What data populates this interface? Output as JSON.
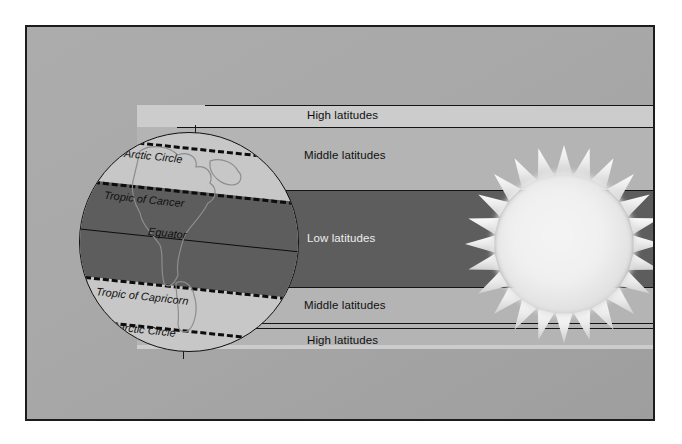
{
  "figure": {
    "panel_background": "#a8a8a8",
    "border_color": "#1c1c1c"
  },
  "colors": {
    "high_latitude_band": "#cccccc",
    "middle_latitude_band": "#b4b4b4",
    "low_latitude_band": "#5d5d5d",
    "globe_light": "#c7c7c7",
    "globe_dark": "#5d5d5d",
    "line": "#141414",
    "sun_core": "#f2f2f2"
  },
  "zones": {
    "high_top": "High latitudes",
    "middle_top": "Middle latitudes",
    "low": "Low latitudes",
    "middle_bottom": "Middle latitudes",
    "high_bottom": "High latitudes"
  },
  "globe": {
    "lines": [
      {
        "name": "arctic-circle",
        "label": "Arctic Circle",
        "style": "dashed"
      },
      {
        "name": "tropic-of-cancer",
        "label": "Tropic of Cancer",
        "style": "dashed"
      },
      {
        "name": "equator",
        "label": "Equator",
        "style": "solid"
      },
      {
        "name": "tropic-of-capricorn",
        "label": "Tropic of Capricorn",
        "style": "dashed"
      },
      {
        "name": "antarctic-circle",
        "label": "Antarctic Circle",
        "style": "dashed"
      }
    ]
  },
  "sun": {
    "name": "sun",
    "ray_count": 24
  }
}
